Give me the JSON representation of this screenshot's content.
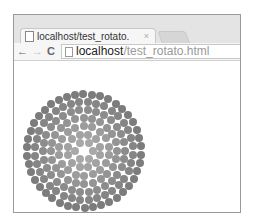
{
  "browser": {
    "tab": {
      "title": "localhost/test_rotato.",
      "close": "×"
    },
    "nav": {
      "back": "←",
      "forward": "→",
      "reload": "C"
    },
    "address": {
      "host": "localhost",
      "path": "/test_rotato.html"
    }
  },
  "content": {
    "pattern": {
      "type": "concentric-dot-rings",
      "center": [
        70,
        90
      ],
      "rings": [
        {
          "radius": 9,
          "count": 6,
          "color": "#a8a8a8"
        },
        {
          "radius": 17,
          "count": 12,
          "color": "#a2a2a2"
        },
        {
          "radius": 25,
          "count": 18,
          "color": "#9c9c9c"
        },
        {
          "radius": 33,
          "count": 24,
          "color": "#949494"
        },
        {
          "radius": 41,
          "count": 30,
          "color": "#8c8c8c"
        },
        {
          "radius": 49,
          "count": 36,
          "color": "#858585"
        },
        {
          "radius": 57,
          "count": 42,
          "color": "#7c7c7c"
        }
      ]
    }
  }
}
